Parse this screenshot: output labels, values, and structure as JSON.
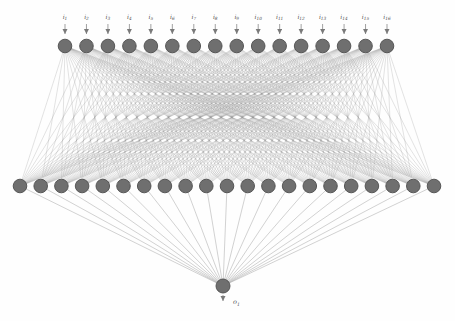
{
  "figure": {
    "kind": "feedforward-neural-network-diagram",
    "background": "#fefefe"
  },
  "network": {
    "type": "diagram",
    "input_layer": {
      "count": 16,
      "labels": [
        {
          "base": "i",
          "sub": "1"
        },
        {
          "base": "i",
          "sub": "2"
        },
        {
          "base": "i",
          "sub": "3"
        },
        {
          "base": "i",
          "sub": "4"
        },
        {
          "base": "i",
          "sub": "5"
        },
        {
          "base": "i",
          "sub": "6"
        },
        {
          "base": "i",
          "sub": "7"
        },
        {
          "base": "i",
          "sub": "8"
        },
        {
          "base": "i",
          "sub": "9"
        },
        {
          "base": "i",
          "sub": "10"
        },
        {
          "base": "i",
          "sub": "11"
        },
        {
          "base": "i",
          "sub": "12"
        },
        {
          "base": "i",
          "sub": "13"
        },
        {
          "base": "i",
          "sub": "14"
        },
        {
          "base": "i",
          "sub": "15"
        },
        {
          "base": "i",
          "sub": "16"
        }
      ]
    },
    "hidden_layer": {
      "count": 21,
      "labels": []
    },
    "output_layer": {
      "count": 1,
      "labels": [
        {
          "base": "o",
          "sub": "1"
        }
      ]
    },
    "connectivity": [
      "input-to-hidden: fully connected (16 x 21)",
      "hidden-to-output: fully connected (21 x 1)"
    ]
  },
  "layout": {
    "width": 455,
    "height": 321,
    "input": {
      "y": 46,
      "x_start": 65,
      "x_end": 387,
      "radius": 6.8,
      "label_y": 19,
      "arrow_top": 24,
      "arrow_bottom": 34
    },
    "hidden": {
      "y": 186,
      "x_start": 20,
      "x_end": 434,
      "radius": 6.8
    },
    "output": {
      "x": 223,
      "y": 286,
      "radius": 7,
      "arrow_top": 295,
      "arrow_bottom": 301,
      "label_x": 233,
      "label_y": 304
    },
    "label_font_size": 6,
    "sub_font_size": 4.3,
    "output_font_size": 6.5,
    "output_sub_font_size": 4.6,
    "edge_width": 0.55,
    "edge_opacity": 0.5,
    "out_edge_width": 0.7,
    "out_edge_opacity": 0.75,
    "colors": {
      "node_fill": "#6f6f6f",
      "node_stroke": "#4d4d4d",
      "edge": "#9a9a9a",
      "out_edge": "#a8a8a8",
      "arrow": "#7a7a7a",
      "label": "#555555"
    }
  }
}
